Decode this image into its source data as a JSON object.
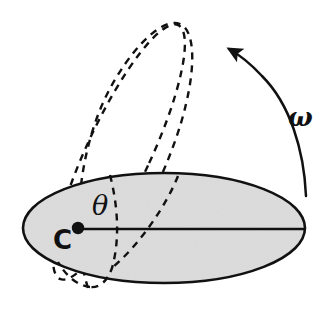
{
  "figure": {
    "background_color": "#ffffff",
    "stroke_color": "#111111",
    "disk_fill_color": "#dcdcdc",
    "labels": {
      "center_point": "C",
      "tilt_angle": "θ",
      "angular_velocity": "ω"
    },
    "icon_names": {
      "disk": "solid-ellipse-disk",
      "tilted_orbit": "dashed-tilted-ellipse",
      "second_orbit": "dashed-secondary-arc",
      "radius": "radius-line",
      "center_dot": "center-dot",
      "rotation_arrow": "curved-rotation-arrow",
      "arrow_head": "arrow-head-icon"
    },
    "geometry": {
      "disk": {
        "cx": 164,
        "cy": 228,
        "rx": 141,
        "ry": 55
      },
      "center_dot": {
        "cx": 78,
        "cy": 228,
        "r": 6
      },
      "radius_line": {
        "x1": 78,
        "y1": 229,
        "x2": 304,
        "y2": 229
      },
      "tilted_ellipse": {
        "cx": 119,
        "cy": 152,
        "rx": 32,
        "ry": 140,
        "rotation_deg": 25
      },
      "dash_pattern": "7 6",
      "arrow_tip": {
        "x": 225,
        "y": 47
      },
      "arrow_tail": {
        "x": 306,
        "y": 196
      }
    }
  }
}
